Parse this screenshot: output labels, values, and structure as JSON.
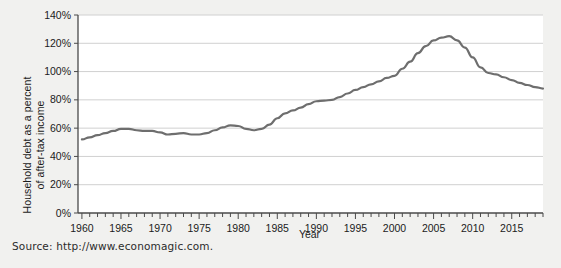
{
  "source_note": "Source: http://www.economagic.com.",
  "chart_data": {
    "type": "line",
    "title": "",
    "xlabel": "Year",
    "ylabel": "Household debt as a percent of after-tax income",
    "ylabel_line1": "Household debt as a percent",
    "ylabel_line2": "of after-tax income",
    "xlim": [
      1959.5,
      2019.0
    ],
    "ylim": [
      0,
      140
    ],
    "ytick_values": [
      0,
      20,
      40,
      60,
      80,
      100,
      120,
      140
    ],
    "ytick_labels": [
      "0%",
      "20%",
      "40%",
      "60%",
      "80%",
      "100%",
      "120%",
      "140%"
    ],
    "xtick_values": [
      1960,
      1965,
      1970,
      1975,
      1980,
      1985,
      1990,
      1995,
      2000,
      2005,
      2010,
      2015
    ],
    "xtick_labels": [
      "1960",
      "1965",
      "1970",
      "1975",
      "1980",
      "1985",
      "1990",
      "1995",
      "2000",
      "2005",
      "2010",
      "2015"
    ],
    "xtick_minor_step": 1,
    "grid": "horizontal",
    "legend": "none",
    "line_color": "#6e6e6e",
    "grid_color": "#d0d0d0",
    "axis_color": "#4a4a4a",
    "plot_background": "#ffffff",
    "figure_background": "#f1f1ef",
    "series": [
      {
        "name": "Household debt as a percent of after-tax income",
        "x": [
          1960,
          1961,
          1962,
          1963,
          1964,
          1965,
          1966,
          1967,
          1968,
          1969,
          1970,
          1971,
          1972,
          1973,
          1974,
          1975,
          1976,
          1977,
          1978,
          1979,
          1980,
          1981,
          1982,
          1983,
          1984,
          1985,
          1986,
          1987,
          1988,
          1989,
          1990,
          1991,
          1992,
          1993,
          1994,
          1995,
          1996,
          1997,
          1998,
          1999,
          2000,
          2001,
          2002,
          2003,
          2004,
          2005,
          2006,
          2007,
          2008,
          2009,
          2010,
          2011,
          2012,
          2013,
          2014,
          2015,
          2016,
          2017,
          2018,
          2019
        ],
        "values": [
          52,
          53.5,
          55,
          56.5,
          58,
          59.5,
          59.5,
          58.5,
          58,
          58,
          57,
          55.5,
          56,
          56.5,
          55.5,
          55.5,
          56.5,
          58.5,
          60.5,
          62,
          61.5,
          59.5,
          58.5,
          59.5,
          62.5,
          67,
          70.5,
          72.5,
          74.5,
          77,
          79,
          79.5,
          80,
          82,
          84.5,
          87,
          89,
          91,
          93,
          95.5,
          97,
          102,
          107,
          113,
          118,
          122,
          124,
          125,
          122,
          117,
          110,
          103,
          99,
          98,
          96,
          94,
          92,
          90.5,
          89,
          88
        ]
      }
    ],
    "annotations": [
      {
        "label": "peak",
        "x": 2007,
        "y": 125
      },
      {
        "label": "trough-start",
        "x": 1960,
        "y": 52
      },
      {
        "label": "end",
        "x": 2019,
        "y": 88
      }
    ]
  }
}
